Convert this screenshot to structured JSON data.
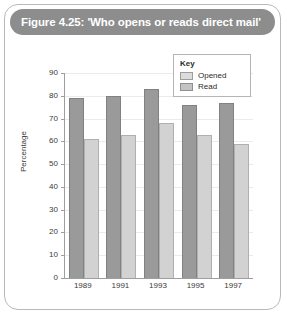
{
  "figure": {
    "title": "Figure 4.25: 'Who opens or reads direct mail'",
    "source": "Source: Royal Mail website"
  },
  "legend": {
    "title": "Key",
    "entries": [
      {
        "label": "Opened",
        "color": "#d2d2d2"
      },
      {
        "label": "Read",
        "color": "#9a9a9a"
      }
    ]
  },
  "colors": {
    "title_bar": "#8d8d8d",
    "frame_border": "#b9b9b9",
    "read_bar": "#9a9a9a",
    "opened_bar": "#d2d2d2",
    "axis": "#9e9e9e"
  },
  "chart_data": {
    "type": "bar",
    "title": "Figure 4.25: 'Who opens or reads direct mail'",
    "xlabel": "",
    "ylabel": "Percentage",
    "categories": [
      "1989",
      "1991",
      "1993",
      "1995",
      "1997"
    ],
    "series": [
      {
        "name": "Read",
        "values": [
          79,
          80,
          83,
          76,
          77
        ],
        "color": "#9a9a9a"
      },
      {
        "name": "Opened",
        "values": [
          61,
          63,
          68,
          63,
          59
        ],
        "color": "#d2d2d2"
      }
    ],
    "ylim": [
      0,
      90
    ],
    "yticks": [
      0,
      10,
      20,
      30,
      40,
      50,
      60,
      70,
      80,
      90
    ],
    "ytick_labels": [
      "0",
      "10",
      "20",
      "30",
      "40",
      "50",
      "60",
      "70",
      "80",
      "90"
    ],
    "grid": true,
    "legend_position": "top-right",
    "source": "Source: Royal Mail website"
  }
}
